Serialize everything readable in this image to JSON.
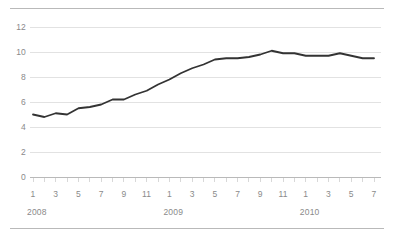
{
  "chart_data": {
    "type": "line",
    "title": "",
    "subtitle": "",
    "xlabel": "",
    "ylabel": "",
    "ylim": [
      0,
      12
    ],
    "ytick_values": [
      0,
      2,
      4,
      6,
      8,
      10,
      12
    ],
    "ytick_labels": [
      "0",
      "2",
      "4",
      "6",
      "8",
      "10",
      "12"
    ],
    "grid": true,
    "grid_axis": "y",
    "legend": false,
    "legend_position": "none",
    "line_color": "#333333",
    "grid_color": "#e2e2e2",
    "axis_color": "#b9b9b9",
    "text_color": "#8a8a8a",
    "xtick_labels": [
      "1",
      "3",
      "5",
      "7",
      "9",
      "11",
      "1",
      "3",
      "5",
      "7",
      "9",
      "11",
      "1",
      "3",
      "5",
      "7"
    ],
    "xtick_months": [
      1,
      3,
      5,
      7,
      9,
      11,
      13,
      15,
      17,
      19,
      21,
      23,
      25,
      27,
      29,
      31
    ],
    "year_labels": [
      "2008",
      "2009",
      "2010"
    ],
    "year_positions": [
      1,
      13,
      25
    ],
    "x": [
      "2008-01",
      "2008-02",
      "2008-03",
      "2008-04",
      "2008-05",
      "2008-06",
      "2008-07",
      "2008-08",
      "2008-09",
      "2008-10",
      "2008-11",
      "2008-12",
      "2009-01",
      "2009-02",
      "2009-03",
      "2009-04",
      "2009-05",
      "2009-06",
      "2009-07",
      "2009-08",
      "2009-09",
      "2009-10",
      "2009-11",
      "2009-12",
      "2010-01",
      "2010-02",
      "2010-03",
      "2010-04",
      "2010-05",
      "2010-06",
      "2010-07"
    ],
    "categories": [
      "1",
      "2",
      "3",
      "4",
      "5",
      "6",
      "7",
      "8",
      "9",
      "10",
      "11",
      "12",
      "1",
      "2",
      "3",
      "4",
      "5",
      "6",
      "7",
      "8",
      "9",
      "10",
      "11",
      "12",
      "1",
      "2",
      "3",
      "4",
      "5",
      "6",
      "7"
    ],
    "values": [
      5.0,
      4.8,
      5.1,
      5.0,
      5.5,
      5.6,
      5.8,
      6.2,
      6.2,
      6.6,
      6.9,
      7.4,
      7.8,
      8.3,
      8.7,
      9.0,
      9.4,
      9.5,
      9.5,
      9.6,
      9.8,
      10.1,
      9.9,
      9.9,
      9.7,
      9.7,
      9.7,
      9.9,
      9.7,
      9.5,
      9.5
    ],
    "series": [
      {
        "name": "Unemployment rate",
        "color": "#333333",
        "values": [
          5.0,
          4.8,
          5.1,
          5.0,
          5.5,
          5.6,
          5.8,
          6.2,
          6.2,
          6.6,
          6.9,
          7.4,
          7.8,
          8.3,
          8.7,
          9.0,
          9.4,
          9.5,
          9.5,
          9.6,
          9.8,
          10.1,
          9.9,
          9.9,
          9.7,
          9.7,
          9.7,
          9.9,
          9.7,
          9.5,
          9.5
        ]
      }
    ]
  }
}
